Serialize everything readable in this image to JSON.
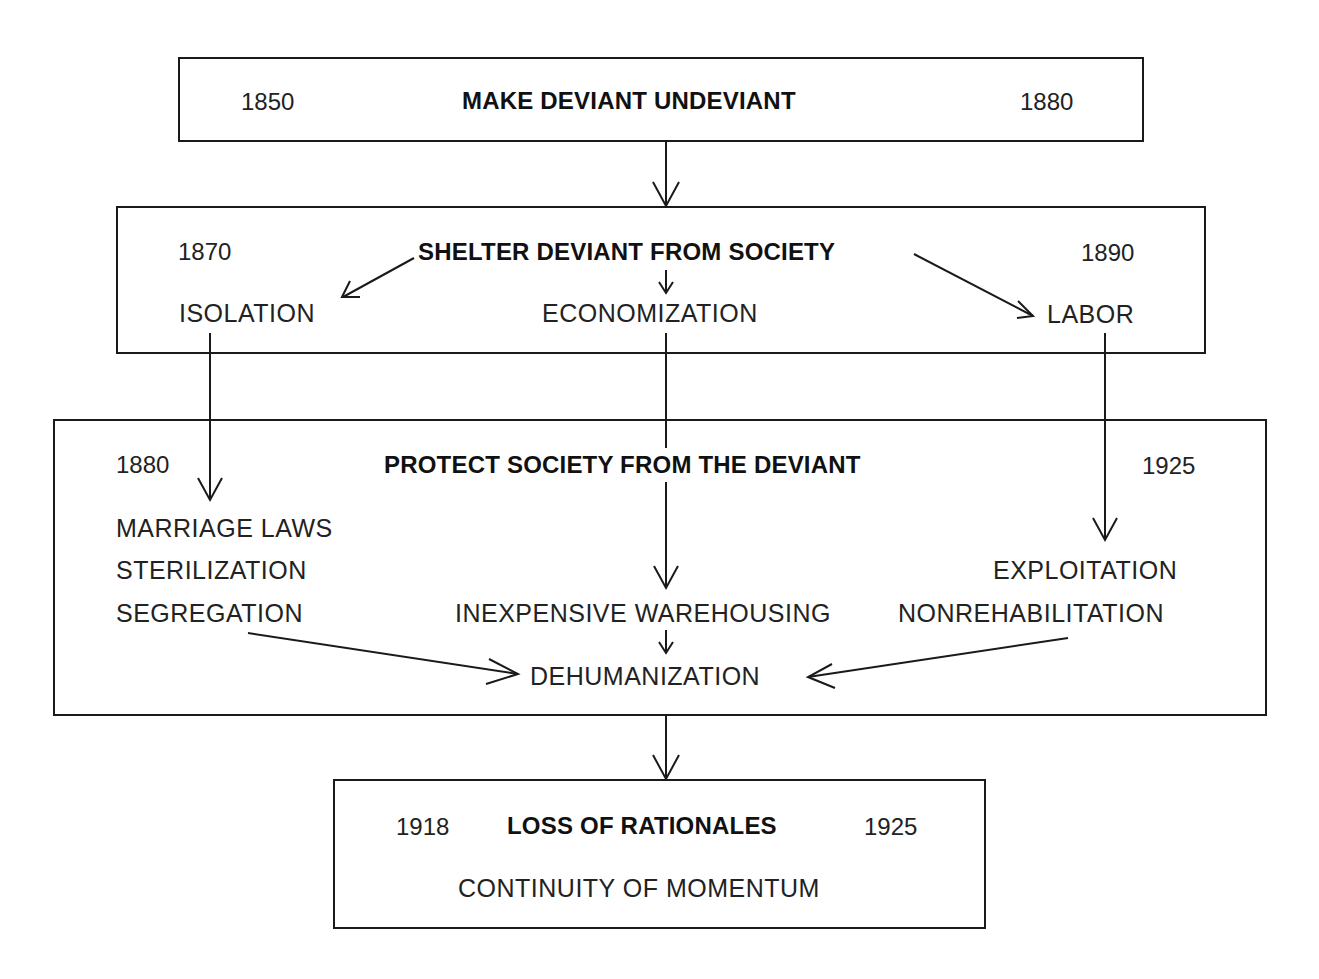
{
  "diagram": {
    "stage1": {
      "title": "MAKE DEVIANT UNDEVIANT",
      "start_year": "1850",
      "end_year": "1880"
    },
    "stage2": {
      "title": "SHELTER DEVIANT FROM SOCIETY",
      "start_year": "1870",
      "end_year": "1890",
      "branches": [
        "ISOLATION",
        "ECONOMIZATION",
        "LABOR"
      ]
    },
    "stage3": {
      "title": "PROTECT SOCIETY FROM THE DEVIANT",
      "start_year": "1880",
      "end_year": "1925",
      "left_items": [
        "MARRIAGE LAWS",
        "STERILIZATION",
        "SEGREGATION"
      ],
      "center_item": "INEXPENSIVE WAREHOUSING",
      "right_items": [
        "EXPLOITATION",
        "NONREHABILITATION"
      ],
      "outcome": "DEHUMANIZATION"
    },
    "stage4": {
      "title": "LOSS OF RATIONALES",
      "start_year": "1918",
      "end_year": "1925",
      "subtitle": "CONTINUITY OF MOMENTUM"
    }
  }
}
